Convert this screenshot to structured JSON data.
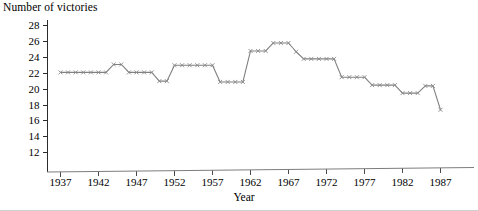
{
  "chart_data": {
    "type": "line",
    "title": "",
    "ylabel": "Number of victories",
    "xlabel": "Year",
    "x": [
      1937,
      1938,
      1939,
      1940,
      1941,
      1942,
      1943,
      1944,
      1945,
      1946,
      1947,
      1948,
      1949,
      1950,
      1951,
      1952,
      1953,
      1954,
      1955,
      1956,
      1957,
      1958,
      1959,
      1960,
      1961,
      1962,
      1963,
      1964,
      1965,
      1966,
      1967,
      1968,
      1969,
      1970,
      1971,
      1972,
      1973,
      1974,
      1975,
      1976,
      1977,
      1978,
      1979,
      1980,
      1981,
      1982,
      1983,
      1984,
      1985,
      1986,
      1987
    ],
    "values": [
      22.1,
      22.1,
      22.1,
      22.1,
      22.1,
      22.1,
      22.1,
      23.1,
      23.1,
      22.1,
      22.1,
      22.1,
      22.1,
      21.0,
      21.0,
      23.0,
      23.0,
      23.0,
      23.0,
      23.0,
      23.0,
      20.9,
      20.9,
      20.9,
      20.9,
      24.8,
      24.8,
      24.8,
      25.8,
      25.8,
      25.8,
      24.7,
      23.8,
      23.8,
      23.8,
      23.8,
      23.8,
      21.5,
      21.5,
      21.5,
      21.5,
      20.5,
      20.5,
      20.5,
      20.5,
      19.5,
      19.5,
      19.5,
      20.4,
      20.4,
      17.4
    ],
    "series": [
      {
        "name": "Number of victories",
        "values": [
          22.1,
          22.1,
          22.1,
          22.1,
          22.1,
          22.1,
          22.1,
          23.1,
          23.1,
          22.1,
          22.1,
          22.1,
          22.1,
          21.0,
          21.0,
          23.0,
          23.0,
          23.0,
          23.0,
          23.0,
          23.0,
          20.9,
          20.9,
          20.9,
          20.9,
          24.8,
          24.8,
          24.8,
          25.8,
          25.8,
          25.8,
          24.7,
          23.8,
          23.8,
          23.8,
          23.8,
          23.8,
          21.5,
          21.5,
          21.5,
          21.5,
          20.5,
          20.5,
          20.5,
          20.5,
          19.5,
          19.5,
          19.5,
          20.4,
          20.4,
          17.4
        ]
      }
    ],
    "y_ticks": [
      12,
      14,
      16,
      18,
      20,
      22,
      24,
      26,
      28
    ],
    "x_ticks": [
      1937,
      1942,
      1947,
      1952,
      1957,
      1962,
      1967,
      1972,
      1977,
      1982,
      1987
    ],
    "ylim": [
      11,
      29
    ],
    "xlim": [
      1936,
      1988
    ],
    "grid": false,
    "legend": null,
    "marker": "x",
    "line_color": "#808080",
    "axis_color": "#2b2b2b"
  },
  "labels": {
    "y_axis_title": "Number of victories",
    "x_axis_title": "Year"
  }
}
